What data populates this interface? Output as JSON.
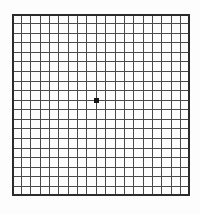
{
  "grid": {
    "label": "Amsler grid test pattern",
    "columns": 19,
    "rows": 19,
    "line_color": "#4a4a4a",
    "border_color": "#2b2b2b",
    "background_color": "#fdfdfd",
    "dot": {
      "label": "central fixation dot",
      "color": "#141414",
      "col": 9,
      "row": 9,
      "size": 5
    }
  }
}
